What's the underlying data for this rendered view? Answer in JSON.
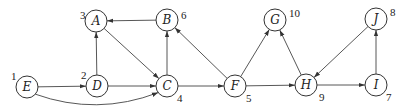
{
  "diagram": {
    "type": "directed-graph",
    "node_radius": 11,
    "nodes": [
      {
        "id": "E",
        "label": "E",
        "order": "1",
        "x": 27,
        "y": 87,
        "ox": 11,
        "oy": 80
      },
      {
        "id": "D",
        "label": "D",
        "order": "2",
        "x": 97,
        "y": 86,
        "ox": 81,
        "oy": 79
      },
      {
        "id": "A",
        "label": "A",
        "order": "3",
        "x": 96,
        "y": 21,
        "ox": 80,
        "oy": 19
      },
      {
        "id": "B",
        "label": "B",
        "order": "6",
        "x": 167,
        "y": 20,
        "ox": 181,
        "oy": 19
      },
      {
        "id": "C",
        "label": "C",
        "order": "4",
        "x": 167,
        "y": 86,
        "ox": 177,
        "oy": 102
      },
      {
        "id": "F",
        "label": "F",
        "order": "5",
        "x": 235,
        "y": 86,
        "ox": 246,
        "oy": 102
      },
      {
        "id": "G",
        "label": "G",
        "order": "10",
        "x": 275,
        "y": 20,
        "ox": 289,
        "oy": 17
      },
      {
        "id": "H",
        "label": "H",
        "order": "9",
        "x": 306,
        "y": 85,
        "ox": 319,
        "oy": 101
      },
      {
        "id": "I",
        "label": "I",
        "order": "7",
        "x": 376,
        "y": 85,
        "ox": 386,
        "oy": 101
      },
      {
        "id": "J",
        "label": "J",
        "order": "8",
        "x": 376,
        "y": 19,
        "ox": 390,
        "oy": 16
      }
    ],
    "edges": [
      {
        "from": "E",
        "to": "D"
      },
      {
        "from": "E",
        "to": "C",
        "curved": true
      },
      {
        "from": "D",
        "to": "A"
      },
      {
        "from": "D",
        "to": "C"
      },
      {
        "from": "A",
        "to": "C"
      },
      {
        "from": "B",
        "to": "A"
      },
      {
        "from": "C",
        "to": "B"
      },
      {
        "from": "C",
        "to": "F"
      },
      {
        "from": "F",
        "to": "B"
      },
      {
        "from": "F",
        "to": "G"
      },
      {
        "from": "F",
        "to": "H"
      },
      {
        "from": "H",
        "to": "G"
      },
      {
        "from": "H",
        "to": "I"
      },
      {
        "from": "J",
        "to": "H"
      },
      {
        "from": "I",
        "to": "J"
      }
    ]
  }
}
